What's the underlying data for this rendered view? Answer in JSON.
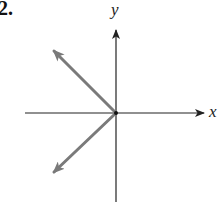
{
  "problem": {
    "number": "2."
  },
  "axes": {
    "x_label": "x",
    "y_label": "y",
    "origin": [
      116,
      113
    ],
    "x_axis": {
      "from": [
        25,
        113
      ],
      "to": [
        205,
        113
      ]
    },
    "y_axis": {
      "from": [
        116,
        202
      ],
      "to": [
        116,
        29
      ]
    },
    "color": "#222222"
  },
  "vectors": [
    {
      "name": "upper-left-vector",
      "from": [
        116,
        113
      ],
      "to": [
        53,
        50
      ],
      "color": "#7a7a7a"
    },
    {
      "name": "lower-left-vector",
      "from": [
        116,
        113
      ],
      "to": [
        53,
        173
      ],
      "color": "#7a7a7a"
    }
  ]
}
